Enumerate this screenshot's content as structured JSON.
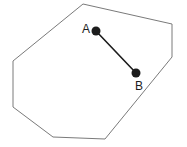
{
  "figure": {
    "canvas": {
      "width": 187,
      "height": 147,
      "background": "#ffffff"
    },
    "shape": {
      "name": "heptagon",
      "sides": 7,
      "stroke_color": "#7a7a7a",
      "fill_color": "#ffffff",
      "stroke_width": 1,
      "vertices": [
        {
          "x": 83,
          "y": 4
        },
        {
          "x": 172,
          "y": 24
        },
        {
          "x": 172,
          "y": 57
        },
        {
          "x": 105,
          "y": 139
        },
        {
          "x": 53,
          "y": 137
        },
        {
          "x": 13,
          "y": 107
        },
        {
          "x": 13,
          "y": 61
        }
      ]
    },
    "segment": {
      "name": "segment-ab",
      "stroke_color": "#1c1c1c",
      "stroke_width": 1.6,
      "from": "A",
      "to": "B"
    },
    "points": [
      {
        "id": "A",
        "label": "A",
        "x": 96,
        "y": 31,
        "radius": 4.5,
        "color": "#1c1c1c",
        "label_x": 86,
        "label_y": 33,
        "label_anchor": "middle"
      },
      {
        "id": "B",
        "label": "B",
        "x": 136,
        "y": 73,
        "radius": 4.5,
        "color": "#1c1c1c",
        "label_x": 139,
        "label_y": 90,
        "label_anchor": "middle"
      }
    ]
  }
}
